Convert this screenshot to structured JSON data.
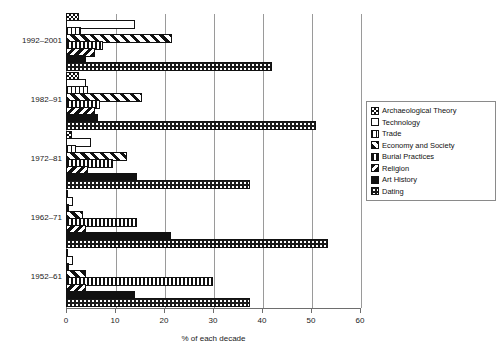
{
  "chart": {
    "title": "",
    "xlabel": "% of each decade",
    "ylabel": ""
  },
  "axis": {
    "ticks": [
      "0",
      "10",
      "20",
      "30",
      "40",
      "50",
      "60"
    ]
  },
  "legend": {
    "items": [
      {
        "label": "Archaeological Theory",
        "pattern": "checker-net"
      },
      {
        "label": "Technology",
        "pattern": "empty-white"
      },
      {
        "label": "Trade",
        "pattern": "vertical-thin-lines"
      },
      {
        "label": "Economy and Society",
        "pattern": "diagonal-stripes-forward"
      },
      {
        "label": "Burial Practices",
        "pattern": "vertical-thick-lines"
      },
      {
        "label": "Religion",
        "pattern": "diagonal-stripes-back"
      },
      {
        "label": "Art History",
        "pattern": "solid-black"
      },
      {
        "label": "Dating",
        "pattern": "dotted-dark"
      }
    ]
  },
  "chart_data": {
    "type": "bar",
    "orientation": "horizontal",
    "title": "",
    "xlabel": "% of each decade",
    "ylabel": "",
    "xlim": [
      0,
      60
    ],
    "grid": true,
    "legend_position": "right",
    "categories": [
      "1992–2001",
      "1982–91",
      "1972–81",
      "1962–71",
      "1952–61"
    ],
    "series": [
      {
        "name": "Archaeological Theory",
        "values": [
          2.7,
          2.7,
          1.2,
          0.4,
          0.4
        ]
      },
      {
        "name": "Technology",
        "values": [
          14.0,
          4.0,
          5.0,
          1.5,
          1.5
        ]
      },
      {
        "name": "Trade",
        "values": [
          3.0,
          4.5,
          2.0,
          0.6,
          0.6
        ]
      },
      {
        "name": "Economy and Society",
        "values": [
          21.6,
          15.5,
          12.5,
          3.5,
          4.0
        ]
      },
      {
        "name": "Burial Practices",
        "values": [
          7.5,
          7.0,
          9.5,
          14.5,
          30.0
        ]
      },
      {
        "name": "Religion",
        "values": [
          6.0,
          6.0,
          4.5,
          4.0,
          4.0
        ]
      },
      {
        "name": "Art History",
        "values": [
          4.0,
          6.5,
          14.5,
          21.5,
          14.0
        ]
      },
      {
        "name": "Dating",
        "values": [
          42.0,
          51.0,
          37.5,
          53.5,
          37.5
        ]
      }
    ]
  }
}
